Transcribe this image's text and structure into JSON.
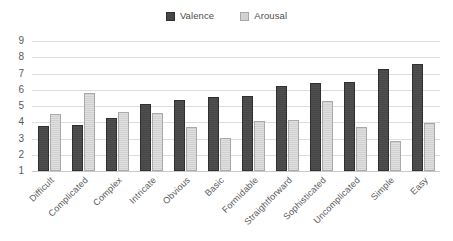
{
  "chart_data": {
    "type": "bar",
    "title": "",
    "subtitle": "",
    "xlabel": "",
    "ylabel": "",
    "ylim": [
      1,
      9
    ],
    "ytick_labels": [
      "9",
      "8",
      "7",
      "6",
      "5",
      "4",
      "3",
      "2",
      "1"
    ],
    "grid": true,
    "legend_position": "top-center",
    "categories": [
      "Difficult",
      "Complicated",
      "Complex",
      "Intricate",
      "Obvious",
      "Basic",
      "Formidable",
      "Straightforward",
      "Sophisticated",
      "Uncomplicated",
      "Simple",
      "Easy"
    ],
    "series": [
      {
        "name": "Valence",
        "color": "#474747",
        "values": [
          3.8,
          3.85,
          4.25,
          5.15,
          5.4,
          5.55,
          5.6,
          6.25,
          6.4,
          6.45,
          7.3,
          7.6
        ]
      },
      {
        "name": "Arousal",
        "color": "#d0d0d0",
        "values": [
          4.5,
          5.8,
          4.65,
          4.55,
          3.7,
          3.05,
          4.1,
          4.15,
          5.3,
          3.7,
          2.85,
          3.95
        ]
      }
    ]
  },
  "legend": {
    "items": [
      {
        "label": "Valence",
        "swatch": "valence-swatch"
      },
      {
        "label": "Arousal",
        "swatch": "arousal-swatch"
      }
    ]
  }
}
